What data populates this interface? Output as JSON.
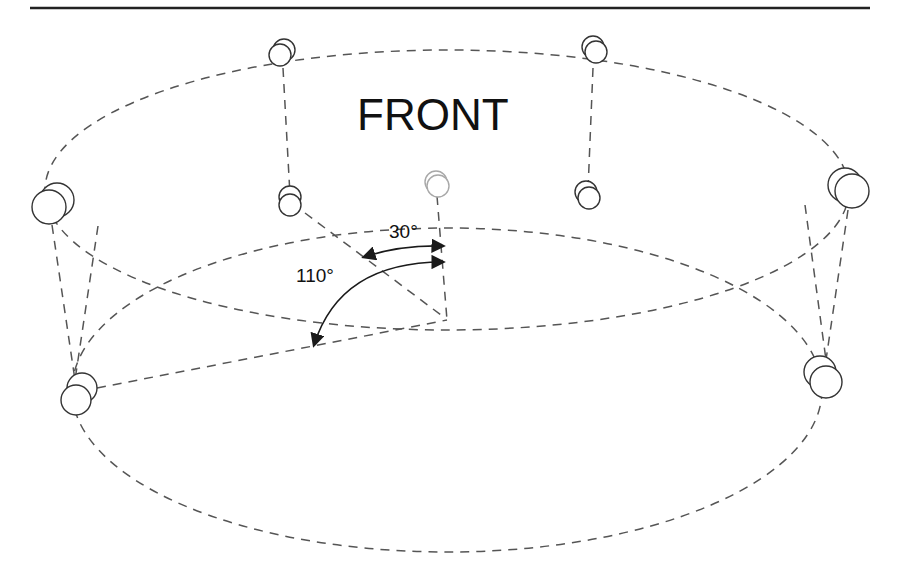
{
  "diagram": {
    "title_label": "FRONT",
    "angles": [
      {
        "label": "30°",
        "from": "center-front",
        "to": "front-left-ear"
      },
      {
        "label": "110°",
        "from": "center-front",
        "to": "surround-left"
      }
    ],
    "speakers": [
      {
        "id": "top-front-left",
        "layer": "height"
      },
      {
        "id": "top-front-right",
        "layer": "height"
      },
      {
        "id": "top-side-left",
        "layer": "height"
      },
      {
        "id": "top-side-right",
        "layer": "height"
      },
      {
        "id": "front-left",
        "layer": "ear"
      },
      {
        "id": "center",
        "layer": "ear",
        "faint": true
      },
      {
        "id": "front-right",
        "layer": "ear"
      },
      {
        "id": "surround-left",
        "layer": "ear"
      },
      {
        "id": "surround-right",
        "layer": "ear"
      }
    ],
    "colors": {
      "line": "#555555",
      "speaker_outline": "#333333",
      "center_speaker_outline": "#a8a8a8",
      "text": "#111111",
      "rule": "#222222"
    }
  }
}
